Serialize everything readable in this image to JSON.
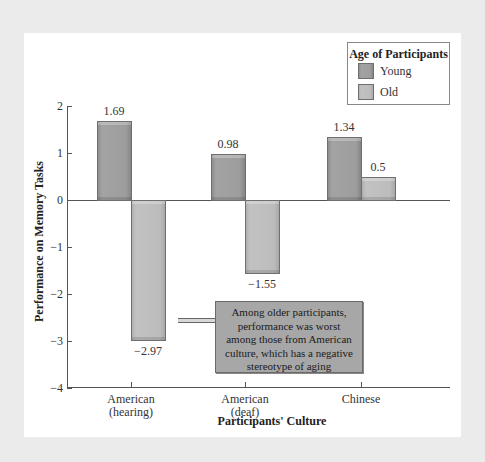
{
  "chart_data": {
    "type": "bar",
    "title": "",
    "xlabel": "Participants' Culture",
    "ylabel": "Performance on Memory Tasks",
    "ylim": [
      -4,
      2
    ],
    "yticks": [
      2,
      1,
      0,
      -1,
      -2,
      -3,
      -4
    ],
    "ytick_labels": [
      "2",
      "1",
      "0",
      "−1",
      "−2",
      "−3",
      "−4"
    ],
    "grid": false,
    "legend_position": "top-right",
    "legend_title": "Age of Participants",
    "categories": [
      "American (hearing)",
      "American (deaf)",
      "Chinese"
    ],
    "category_lines": [
      [
        "American",
        "(hearing)"
      ],
      [
        "American",
        "(deaf)"
      ],
      [
        "Chinese"
      ]
    ],
    "series": [
      {
        "name": "Young",
        "color": "#9d9d9d",
        "values": [
          1.69,
          0.98,
          1.34
        ],
        "labels": [
          "1.69",
          "0.98",
          "1.34"
        ]
      },
      {
        "name": "Old",
        "color": "#bcbcbc",
        "values": [
          -2.97,
          -1.55,
          0.5
        ],
        "labels": [
          "−2.97",
          "−1.55",
          "0.5"
        ]
      }
    ],
    "annotation": {
      "text_lines": [
        "Among older participants,",
        "performance was worst",
        "among those from American",
        "culture, which has a negative",
        "stereotype of aging"
      ],
      "points_to": "American (hearing) / Old",
      "box_color": "#a7a7a7"
    }
  },
  "colors": {
    "background": "#ebebeb",
    "panel": "#ffffff",
    "axis": "#555555"
  }
}
